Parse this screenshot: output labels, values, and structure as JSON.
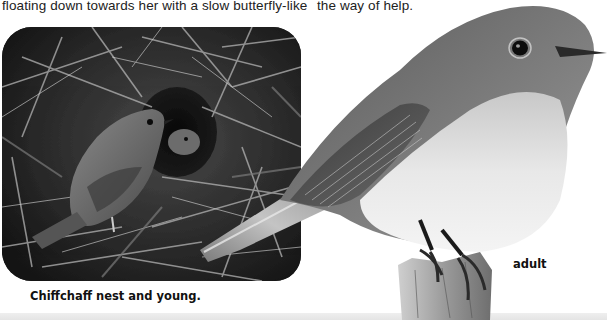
{
  "page": {
    "body_text": {
      "left_column_line": "floating down towards her with a slow butterfly-like",
      "right_column_line": "the way of help."
    },
    "figures": [
      {
        "id": "nest",
        "subject": "Chiffchaff nest with adult bird and young",
        "caption": "Chiffchaff nest and young.",
        "style": "grayscale photo, rounded frame"
      },
      {
        "id": "adult",
        "subject": "Adult chiffchaff perched on a stump",
        "caption": "adult",
        "style": "grayscale cut-out photo"
      }
    ]
  },
  "colors": {
    "text": "#222222",
    "caption": "#111111",
    "background": "#ffffff",
    "bottom_band": "#e8e8e8"
  }
}
